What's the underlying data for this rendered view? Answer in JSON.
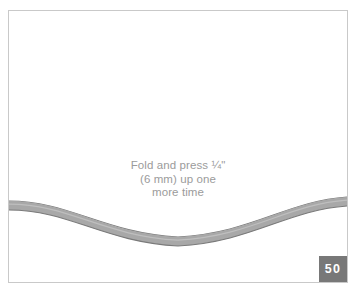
{
  "page": {
    "background_color": "#ffffff",
    "frame_border_color": "#c9c9c9"
  },
  "illustration": {
    "name": "curved-fabric-hem",
    "description": "Curved fabric edge with folded hem band",
    "band_fill_color": "#a8a8a8",
    "band_outline_color": "#7a7a7a",
    "band_highlight_color": "#c2c2c2"
  },
  "caption": {
    "color": "#9b9b9b",
    "lines": [
      "Fold and press ¼\"",
      "(6 mm) up one",
      "more time"
    ],
    "line1": "Fold and press ¼\"",
    "line2": "(6 mm) up one",
    "line3": "more time"
  },
  "page_badge": {
    "number": "50",
    "background_color": "#787878",
    "text_color": "#ffffff"
  }
}
